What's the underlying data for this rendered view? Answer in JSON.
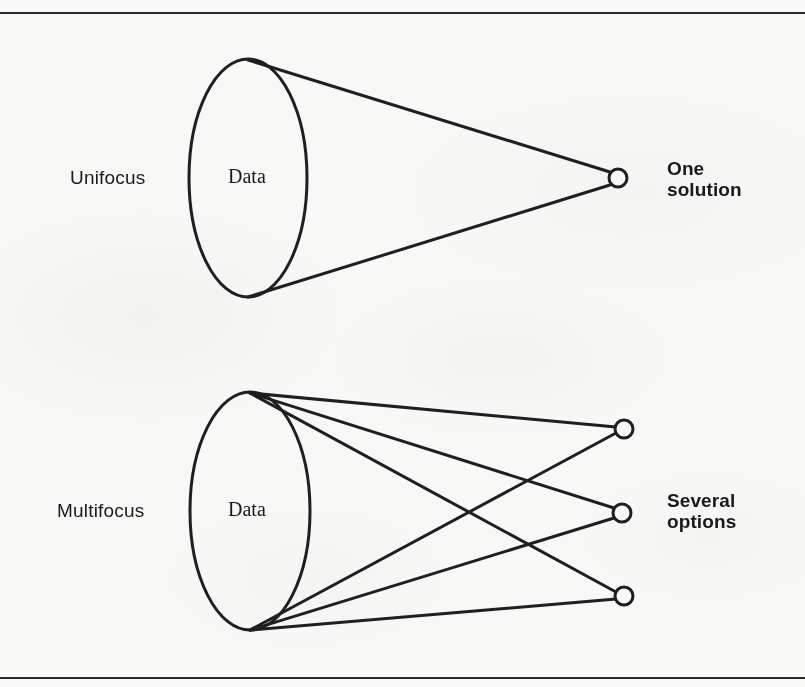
{
  "page": {
    "background_color": "#f8f8f7",
    "ink_color": "#1f1f1f",
    "width": 805,
    "height": 687,
    "clipped_header_fragment": "g"
  },
  "rules": {
    "top_label": "top-horizontal-rule",
    "bottom_label": "bottom-horizontal-rule"
  },
  "diagram": {
    "type": "concept-diagram",
    "rows": [
      {
        "id": "unifocus",
        "mode_label": "Unifocus",
        "source_label": "Data",
        "outcome_label_line1": "One",
        "outcome_label_line2": "solution",
        "outcome_count": 1
      },
      {
        "id": "multifocus",
        "mode_label": "Multifocus",
        "source_label": "Data",
        "outcome_label_line1": "Several",
        "outcome_label_line2": "options",
        "outcome_count": 3
      }
    ],
    "geometry": {
      "top_ellipse": {
        "cx": 248,
        "cy": 178,
        "rx": 59,
        "ry": 119
      },
      "bottom_ellipse": {
        "cx": 250,
        "cy": 511,
        "rx": 60,
        "ry": 119
      },
      "top_node": {
        "cx": 618,
        "cy": 178,
        "r": 9
      },
      "bottom_nodes": [
        {
          "cx": 624,
          "cy": 429,
          "r": 9
        },
        {
          "cx": 622,
          "cy": 513,
          "r": 9
        },
        {
          "cx": 624,
          "cy": 596,
          "r": 9
        }
      ],
      "stroke_width": 3
    }
  }
}
